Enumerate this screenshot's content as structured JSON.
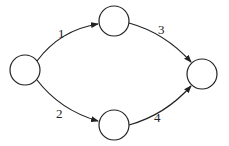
{
  "diagram": {
    "type": "directed-graph",
    "nodes": [
      {
        "id": "n1",
        "label": ""
      },
      {
        "id": "n2",
        "label": ""
      },
      {
        "id": "n3",
        "label": ""
      },
      {
        "id": "n4",
        "label": ""
      }
    ],
    "edges": [
      {
        "from": "n1",
        "to": "n2",
        "label": "1"
      },
      {
        "from": "n1",
        "to": "n3",
        "label": "2"
      },
      {
        "from": "n2",
        "to": "n4",
        "label": "3"
      },
      {
        "from": "n3",
        "to": "n4",
        "label": "4"
      }
    ],
    "colors": {
      "stroke": "#222222",
      "background": "#ffffff"
    }
  }
}
